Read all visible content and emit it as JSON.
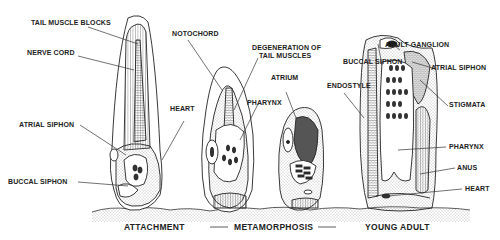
{
  "diagram": {
    "stages": [
      "ATTACHMENT",
      "METAMORPHOSIS",
      "YOUNG ADULT"
    ],
    "labels": {
      "tail_muscle_blocks": "TAIL MUSCLE BLOCKS",
      "nerve_cord": "NERVE CORD",
      "notochord": "NOTOCHORD",
      "heart_1": "HEART",
      "atrial_siphon_1": "ATRIAL SIPHON",
      "buccal_siphon_1": "BUCCAL SIPHON",
      "degeneration_1": "DEGENERATION OF",
      "degeneration_2": "TAIL MUSCLES",
      "pharynx_1": "PHARYNX",
      "atrium": "ATRIUM",
      "endostyle": "ENDOSTYLE",
      "buccal_siphon_2": "BUCCAL SIPHON",
      "adult_ganglion": "ADULT GANGLION",
      "atrial_siphon_2": "ATRIAL SIPHON",
      "stigmata": "STIGMATA",
      "pharynx_2": "PHARYNX",
      "anus": "ANUS",
      "heart_2": "HEART"
    },
    "colors": {
      "ink": "#222222",
      "background": "#ffffff",
      "stipple": "#888888"
    }
  }
}
